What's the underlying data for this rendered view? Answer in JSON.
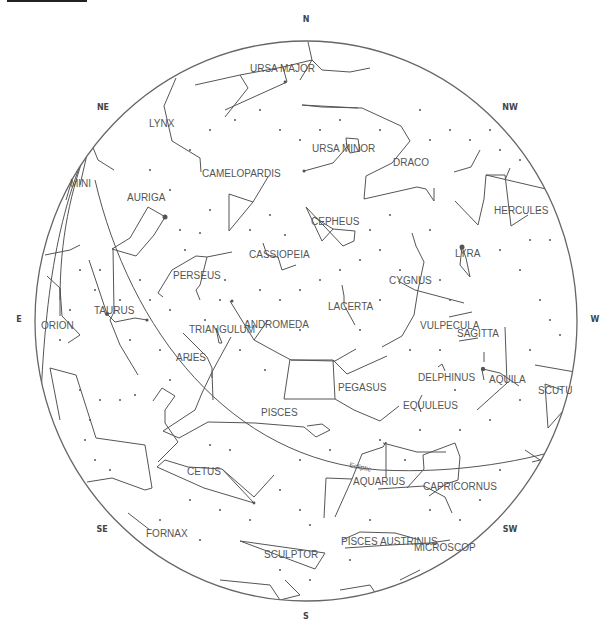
{
  "chart": {
    "horizon": {
      "cx": 306,
      "cy": 321,
      "rx": 271,
      "ry": 280
    },
    "compass": [
      {
        "label": "N",
        "x": 306,
        "y": 22
      },
      {
        "label": "NE",
        "x": 103,
        "y": 110
      },
      {
        "label": "E",
        "x": 19,
        "y": 322
      },
      {
        "label": "SE",
        "x": 102,
        "y": 532
      },
      {
        "label": "S",
        "x": 306,
        "y": 619
      },
      {
        "label": "SW",
        "x": 510,
        "y": 532
      },
      {
        "label": "NW",
        "x": 510,
        "y": 110
      },
      {
        "label": "W",
        "x": 595,
        "y": 322
      }
    ],
    "constellations": [
      {
        "label": "URSA MAJOR",
        "x": 250,
        "y": 72
      },
      {
        "label": "LYNX",
        "x": 149,
        "y": 127
      },
      {
        "label": "URSA MINOR",
        "x": 312,
        "y": 152
      },
      {
        "label": "DRACO",
        "x": 393,
        "y": 166
      },
      {
        "label": "CAMELOPARDIS",
        "x": 202,
        "y": 177
      },
      {
        "label": "MINI",
        "x": 70,
        "y": 187
      },
      {
        "label": "AURIGA",
        "x": 127,
        "y": 201
      },
      {
        "label": "HERCULES",
        "x": 494,
        "y": 214
      },
      {
        "label": "CEPHEUS",
        "x": 311,
        "y": 225
      },
      {
        "label": "CASSIOPEIA",
        "x": 249,
        "y": 258
      },
      {
        "label": "LYRA",
        "x": 455,
        "y": 257
      },
      {
        "label": "PERSEUS",
        "x": 173,
        "y": 279
      },
      {
        "label": "CYGNUS",
        "x": 389,
        "y": 284
      },
      {
        "label": "TAURUS",
        "x": 94,
        "y": 314
      },
      {
        "label": "LACERTA",
        "x": 328,
        "y": 310
      },
      {
        "label": "ORION",
        "x": 41,
        "y": 329
      },
      {
        "label": "TRIANGULUM",
        "x": 189,
        "y": 333
      },
      {
        "label": "ANDROMEDA",
        "x": 244,
        "y": 328
      },
      {
        "label": "VULPECULA",
        "x": 420,
        "y": 329
      },
      {
        "label": "SAGITTA",
        "x": 457,
        "y": 337
      },
      {
        "label": "ARIES",
        "x": 176,
        "y": 361
      },
      {
        "label": "PEGASUS",
        "x": 338,
        "y": 391
      },
      {
        "label": "DELPHINUS",
        "x": 418,
        "y": 381
      },
      {
        "label": "AQUILA",
        "x": 489,
        "y": 383
      },
      {
        "label": "SCUTU",
        "x": 538,
        "y": 394
      },
      {
        "label": "EQUULEUS",
        "x": 403,
        "y": 409
      },
      {
        "label": "PISCES",
        "x": 261,
        "y": 416
      },
      {
        "label": "AQUARIUS",
        "x": 353,
        "y": 485
      },
      {
        "label": "CAPRICORNUS",
        "x": 423,
        "y": 490
      },
      {
        "label": "CETUS",
        "x": 187,
        "y": 475
      },
      {
        "label": "FORNAX",
        "x": 146,
        "y": 537
      },
      {
        "label": "SCULPTOR",
        "x": 264,
        "y": 558
      },
      {
        "label": "PISCES AUSTRINUS",
        "x": 341,
        "y": 545
      },
      {
        "label": "MICROSCOP",
        "x": 414,
        "y": 551
      }
    ],
    "ecliptic_label": {
      "label": "Ecliptic",
      "x": 349,
      "y": 467
    }
  }
}
